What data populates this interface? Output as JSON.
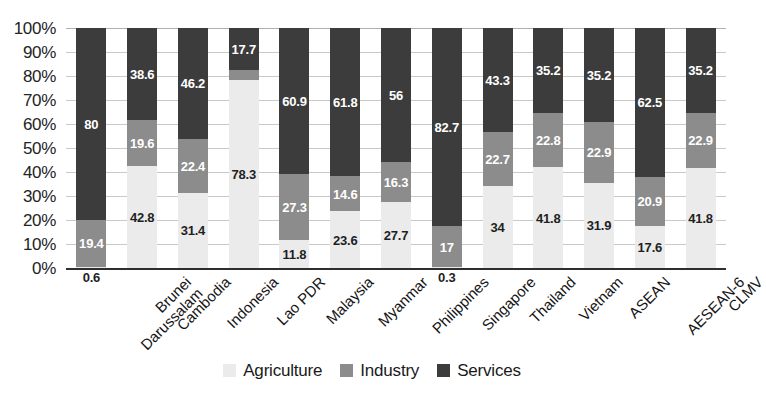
{
  "chart_data": {
    "type": "bar",
    "variant": "stacked-100-percent",
    "title": "",
    "xlabel": "",
    "ylabel": "",
    "ylim": [
      0,
      100
    ],
    "ytick_labels": [
      "100%",
      "90%",
      "80%",
      "70%",
      "60%",
      "50%",
      "40%",
      "30%",
      "20%",
      "10%",
      "0%"
    ],
    "ytick_values": [
      100,
      90,
      80,
      70,
      60,
      50,
      40,
      30,
      20,
      10,
      0
    ],
    "grid": true,
    "legend_position": "bottom-center",
    "categories": [
      "Brunei Darussalam",
      "Cambodia",
      "Indonesia",
      "Lao PDR",
      "Malaysia",
      "Myanmar",
      "Philippines",
      "Singapore",
      "Thailand",
      "Vietnam",
      "ASEAN",
      "AESEAN-6",
      "CLMV"
    ],
    "category_lines": [
      [
        "Brunei",
        "Darussalam"
      ],
      [
        "Cambodia"
      ],
      [
        "Indonesia"
      ],
      [
        "Lao PDR"
      ],
      [
        "Malaysia"
      ],
      [
        "Myanmar"
      ],
      [
        "Philippines"
      ],
      [
        "Singapore"
      ],
      [
        "Thailand"
      ],
      [
        "Vietnam"
      ],
      [
        "ASEAN"
      ],
      [
        "AESEAN-6"
      ],
      [
        "CLMV"
      ]
    ],
    "series": [
      {
        "name": "Agriculture",
        "color": "#ebebeb",
        "values": [
          0.6,
          42.8,
          31.4,
          78.3,
          11.8,
          23.6,
          27.7,
          0.3,
          34,
          41.8,
          31.9,
          17.6,
          41.8
        ],
        "labels": [
          "0.6",
          "42.8",
          "31.4",
          "78.3",
          "11.8",
          "23.6",
          "27.7",
          "0.3",
          "34",
          "41.8",
          "31.9",
          "17.6",
          "41.8"
        ]
      },
      {
        "name": "Industry",
        "color": "#8c8c8c",
        "values": [
          19.4,
          19.6,
          22.4,
          4.0,
          27.3,
          14.6,
          16.3,
          17,
          22.7,
          22.8,
          22.9,
          20.9,
          22.9
        ],
        "labels": [
          "19.4",
          "19.6",
          "22.4",
          "4",
          "27.3",
          "14.6",
          "16.3",
          "17",
          "22.7",
          "22.8",
          "22.9",
          "20.9",
          "22.9"
        ]
      },
      {
        "name": "Services",
        "color": "#3c3c3c",
        "values": [
          80,
          38.6,
          46.2,
          17.7,
          60.9,
          61.8,
          56,
          82.7,
          43.3,
          35.2,
          35.2,
          62.5,
          35.2
        ],
        "labels": [
          "80",
          "38.6",
          "46.2",
          "17.7",
          "60.9",
          "61.8",
          "56",
          "82.7",
          "43.3",
          "35.2",
          "35.2",
          "62.5",
          "35.2"
        ]
      }
    ]
  },
  "legend": {
    "items": [
      {
        "label": "Agriculture",
        "swatch": "agriculture"
      },
      {
        "label": "Industry",
        "swatch": "industry"
      },
      {
        "label": "Services",
        "swatch": "services"
      }
    ]
  },
  "colors": {
    "agriculture": "#ebebeb",
    "industry": "#8c8c8c",
    "services": "#3c3c3c",
    "axis": "#2e2e2e",
    "grid": "#c9c9c9",
    "text": "#1a1a1a"
  }
}
